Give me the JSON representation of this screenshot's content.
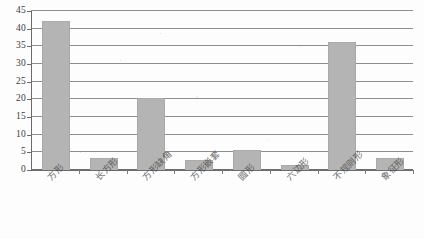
{
  "chart_data": {
    "type": "bar",
    "title": "",
    "xlabel": "",
    "ylabel": "",
    "categories": [
      "方形",
      "长方形",
      "方形缺角",
      "方形嵌套",
      "圆形",
      "六边形",
      "不规则形",
      "象征形"
    ],
    "values": [
      42,
      3,
      20,
      2.5,
      5.3,
      1,
      36,
      3
    ],
    "ylim": [
      0,
      45
    ],
    "ytick_labels": [
      "0",
      "5",
      "10",
      "15",
      "20",
      "25",
      "30",
      "35",
      "40",
      "45"
    ],
    "ytick_values": [
      0,
      5,
      10,
      15,
      20,
      25,
      30,
      35,
      40,
      45
    ],
    "grid": true,
    "legend": false,
    "legend_position": "none",
    "series": [
      {
        "name": "",
        "values": [
          42,
          3,
          20,
          2.5,
          5.3,
          1,
          36,
          3
        ]
      }
    ],
    "bar_color": "#b4b4b4",
    "gridline_color": "#8e8e8e",
    "axis_color": "#6b6b6b"
  },
  "caption": {
    "text": ""
  }
}
